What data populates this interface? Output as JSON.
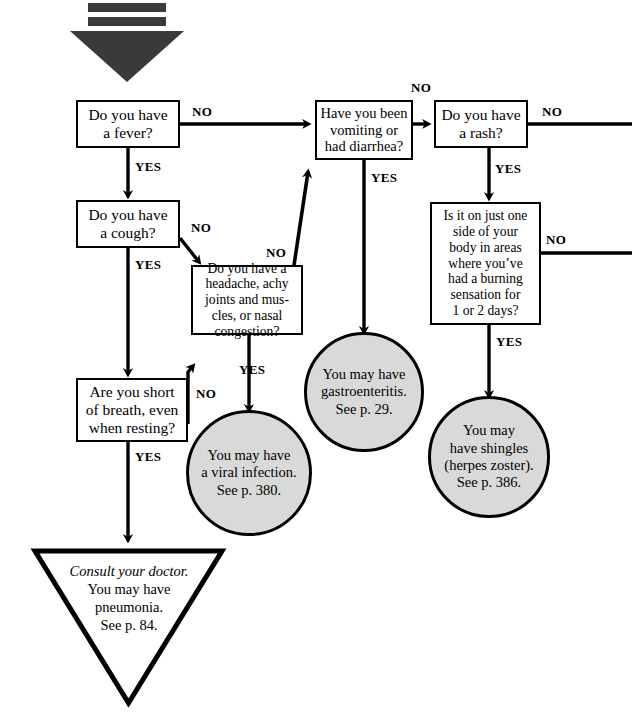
{
  "figure": {
    "background_color": "#ffffff",
    "line_color": "#000000",
    "terminal_fill": "#d9d9d9"
  },
  "start_marker": {
    "name": "start-down-arrow",
    "shape": "thick-down-arrow"
  },
  "nodes": {
    "fever": {
      "label": "Do you have a fever?",
      "line1": "Do you have",
      "line2": "a fever?",
      "shape": "rect"
    },
    "cough": {
      "label": "Do you have a cough?",
      "line1": "Do you have",
      "line2": "a cough?",
      "shape": "rect"
    },
    "breath": {
      "label": "Are you short of breath, even when resting?",
      "line1": "Are you short",
      "line2": "of breath, even",
      "line3": "when resting?",
      "shape": "rect"
    },
    "headache": {
      "label": "Do you have a headache, achy joints and muscles, or nasal congestion?",
      "line1": "Do you have a",
      "line2": "headache, achy",
      "line3": "joints and mus-",
      "line4": "cles, or nasal",
      "line5": "congestion?",
      "shape": "rect"
    },
    "vomiting": {
      "label": "Have you been vomiting or had diarrhea?",
      "line1": "Have you been",
      "line2": "vomiting or",
      "line3": "had diarrhea?",
      "shape": "rect"
    },
    "rash": {
      "label": "Do you have a rash?",
      "line1": "Do you have",
      "line2": "a rash?",
      "shape": "rect"
    },
    "shingles_question": {
      "label": "Is it on just one side of your body in areas where you've had a burning sensation for 1 or 2 days?",
      "line1": "Is it on just one",
      "line2": "side of your",
      "line3": "body in areas",
      "line4": "where you’ve",
      "line5": "had a burning",
      "line6": "sensation for",
      "line7": "1 or 2 days?",
      "shape": "rect"
    },
    "viral": {
      "label": "You may have a viral infection. See p. 380.",
      "line1": "You may have",
      "line2": "a viral infection.",
      "line3": "See p. 380.",
      "shape": "circle"
    },
    "gastro": {
      "label": "You may have gastroenteritis. See p. 29.",
      "line1": "You may have",
      "line2": "gastroenteritis.",
      "line3": "See p. 29.",
      "shape": "circle"
    },
    "shingles": {
      "label": "You may have shingles (herpes zoster). See p. 386.",
      "line1": "You may",
      "line2": "have shingles",
      "line3": "(herpes zoster).",
      "line4": "See p. 386.",
      "shape": "circle"
    },
    "pneumonia": {
      "label": "Consult your doctor. You may have pneumonia. See p. 84.",
      "line1": "Consult your doctor.",
      "line2": "You may have",
      "line3": "pneumonia.",
      "line4": "See p. 84.",
      "shape": "triangle"
    }
  },
  "edge_labels": {
    "fever_no": "NO",
    "fever_yes": "YES",
    "cough_no": "NO",
    "cough_yes": "YES",
    "breath_no": "NO",
    "breath_yes": "YES",
    "headache_no": "NO",
    "headache_yes": "YES",
    "vomiting_no": "NO",
    "vomiting_yes": "YES",
    "rash_no": "NO",
    "rash_yes": "YES",
    "shingles_q_no": "NO",
    "shingles_q_yes": "YES"
  }
}
